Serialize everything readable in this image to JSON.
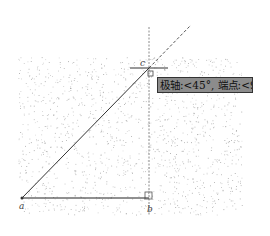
{
  "drawing": {
    "background": "#ffffff",
    "grid_area": {
      "x1": 18,
      "y1": 57,
      "x2": 242,
      "y2": 215,
      "dot_color": "#9a9a9a"
    },
    "points": {
      "a": {
        "label": "a",
        "x": 22,
        "y": 198
      },
      "b": {
        "label": "b",
        "x": 149,
        "y": 198
      },
      "c": {
        "label": "c",
        "x": 149,
        "y": 68
      }
    },
    "lines": {
      "ab": {
        "from": "a",
        "to": "b",
        "style": "solid",
        "color": "#222222"
      },
      "ac": {
        "from": "a",
        "to": "c",
        "style": "solid",
        "color": "#333333"
      }
    },
    "tracking": {
      "polar_extension": {
        "from": [
          149,
          68
        ],
        "to": [
          191,
          25
        ],
        "style": "dashed"
      },
      "vertical_extension": {
        "x": 149,
        "y_from": 27,
        "y_to": 215,
        "style": "dashed"
      }
    },
    "cursor": {
      "x": 149,
      "y": 68,
      "crosshair_half_width": 19
    }
  },
  "tooltip": {
    "text": "极轴:<45°, 端点:<90°",
    "bg_color": "#8c8c8c",
    "border_color": "#333333"
  }
}
